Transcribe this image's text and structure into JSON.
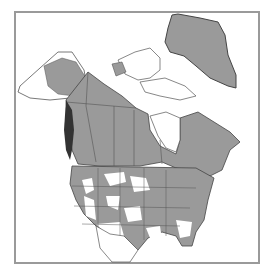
{
  "map": {
    "type": "species range map",
    "region": "North America",
    "colors": {
      "range_fill": "#9a9a9a",
      "background": "#ffffff",
      "border": "#555555",
      "frame": "#9a9a9a",
      "dark_coast": "#333333"
    },
    "regions_shaded": [
      "Greenland",
      "Alaska (partial)",
      "Canada",
      "Contiguous United States (patchy)"
    ]
  }
}
